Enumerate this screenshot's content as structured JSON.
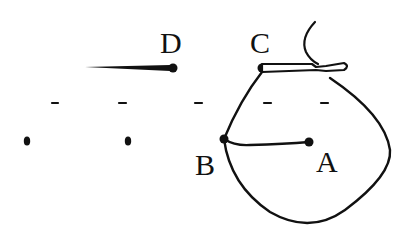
{
  "diagram": {
    "labels": {
      "A": "A",
      "B": "B",
      "C": "C",
      "D": "D"
    },
    "points": {
      "A": {
        "x": 309,
        "y": 142
      },
      "B": {
        "x": 224,
        "y": 139
      },
      "C": {
        "x": 262,
        "y": 68
      },
      "D": {
        "x": 172,
        "y": 68
      }
    },
    "ink_color": "#111111",
    "background": "#ffffff"
  }
}
